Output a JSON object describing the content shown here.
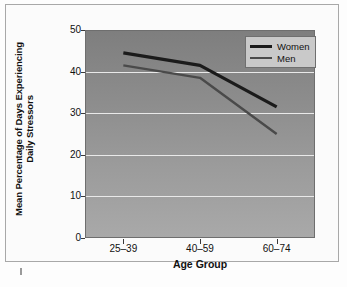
{
  "chart_data": {
    "type": "line",
    "title": "",
    "xlabel": "Age Group",
    "ylabel": "Mean Percentage of Days Experiencing Daily Stressors",
    "ylabel_line1": "Mean Percentage of Days Experiencing",
    "ylabel_line2": "Daily Stressors",
    "categories": [
      "25–39",
      "40–59",
      "60–74"
    ],
    "ylim": [
      0,
      50
    ],
    "yticks": [
      0,
      10,
      20,
      30,
      40,
      50
    ],
    "ytick_labels": [
      "0",
      "10",
      "20",
      "30",
      "40",
      "50"
    ],
    "grid": "horizontal-white",
    "legend_position": "top-right",
    "series": [
      {
        "name": "Women",
        "values": [
          44.5,
          41.5,
          31.5
        ],
        "color": "#1b1b1b",
        "width": 3.2
      },
      {
        "name": "Men",
        "values": [
          41.5,
          38.5,
          25.0
        ],
        "color": "#4a4a4a",
        "width": 2.4
      }
    ]
  },
  "legend": {
    "items": [
      {
        "label": "Women",
        "color": "#1b1b1b"
      },
      {
        "label": "Men",
        "color": "#4a4a4a"
      }
    ]
  },
  "colors": {
    "plot_top": "#7e7e7e",
    "plot_bottom": "#a9a9a9",
    "gridline": "#e9e9e9",
    "frame": "#a8a8a8",
    "legend_bg": "#c9c9c9",
    "text": "#111111"
  }
}
